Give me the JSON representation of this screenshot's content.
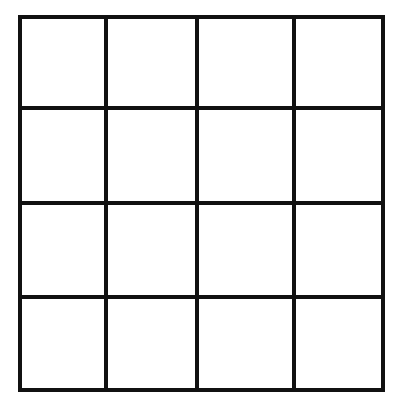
{
  "grid": {
    "rows": 4,
    "cols": 4,
    "line_color": "#111111",
    "background": "#ffffff",
    "stroke_width": 4,
    "x_lines": [
      20,
      106,
      197,
      294,
      383
    ],
    "y_lines": [
      17,
      108,
      203,
      297,
      390
    ]
  }
}
